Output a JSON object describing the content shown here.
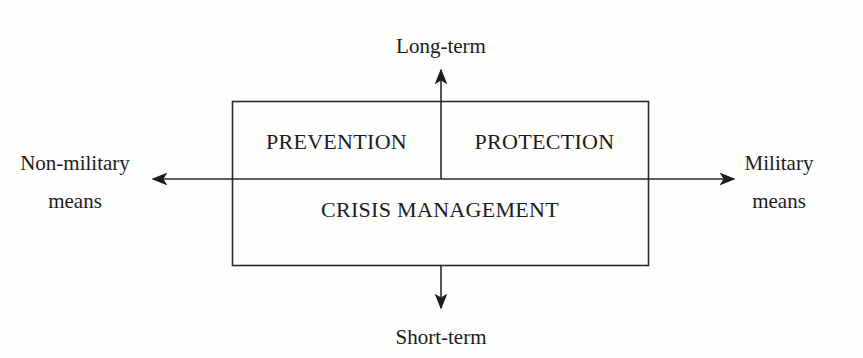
{
  "diagram": {
    "type": "two-axis quadrant diagram",
    "axes": {
      "vertical": {
        "top_label": "Long-term",
        "bottom_label": "Short-term"
      },
      "horizontal": {
        "left_label_line1": "Non-military",
        "left_label_line2": "means",
        "right_label_line1": "Military",
        "right_label_line2": "means"
      }
    },
    "regions": {
      "upper_left": "PREVENTION",
      "upper_right": "PROTECTION",
      "lower": "CRISIS MANAGEMENT"
    },
    "colors": {
      "ink": "#1c1c1c",
      "background": "#fdfdfc"
    }
  }
}
